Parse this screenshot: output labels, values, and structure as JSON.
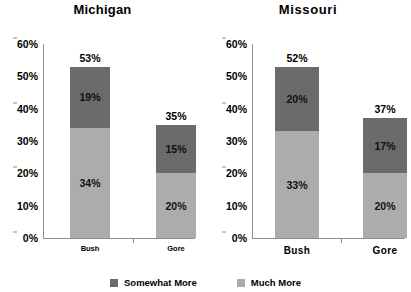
{
  "chart_data": [
    {
      "type": "bar",
      "title": "Michigan",
      "xlabel": "",
      "ylabel": "",
      "ylim": [
        0,
        60
      ],
      "ytick_labels": [
        "0%",
        "10%",
        "20%",
        "30%",
        "40%",
        "50%",
        "60%"
      ],
      "ytick_values": [
        0,
        10,
        20,
        30,
        40,
        50,
        60
      ],
      "grid": false,
      "stacked": true,
      "legend_position": "bottom",
      "categories": [
        "Bush",
        "Gore"
      ],
      "series": [
        {
          "name": "Much More",
          "color": "#acacac",
          "values": [
            34,
            20
          ],
          "labels": [
            "34%",
            "20%"
          ]
        },
        {
          "name": "Somewhat More",
          "color": "#6b6b6b",
          "values": [
            19,
            15
          ],
          "labels": [
            "19%",
            "15%"
          ]
        }
      ],
      "totals": [
        53,
        35
      ],
      "total_labels": [
        "53%",
        "35%"
      ]
    },
    {
      "type": "bar",
      "title": "Missouri",
      "xlabel": "",
      "ylabel": "",
      "ylim": [
        0,
        60
      ],
      "ytick_labels": [
        "0%",
        "10%",
        "20%",
        "30%",
        "40%",
        "50%",
        "60%"
      ],
      "ytick_values": [
        0,
        10,
        20,
        30,
        40,
        50,
        60
      ],
      "grid": false,
      "stacked": true,
      "legend_position": "bottom",
      "categories": [
        "Bush",
        "Gore"
      ],
      "series": [
        {
          "name": "Much More",
          "color": "#acacac",
          "values": [
            33,
            20
          ],
          "labels": [
            "33%",
            "20%"
          ]
        },
        {
          "name": "Somewhat More",
          "color": "#6b6b6b",
          "values": [
            20,
            17
          ],
          "labels": [
            "20%",
            "17%"
          ]
        }
      ],
      "totals": [
        53,
        37
      ],
      "total_labels": [
        "52%",
        "37%"
      ]
    }
  ],
  "legend": {
    "items": [
      {
        "label": "Somewhat More",
        "color": "#6b6b6b"
      },
      {
        "label": "Much More",
        "color": "#acacac"
      }
    ]
  },
  "colors": {
    "somewhat_more": "#6b6b6b",
    "much_more": "#acacac",
    "axis": "#8d8d8d",
    "background": "#ffffff"
  }
}
